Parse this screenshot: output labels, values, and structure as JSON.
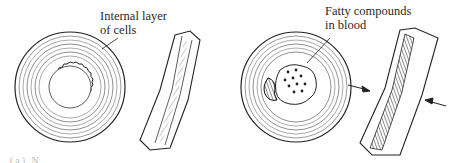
{
  "figure": {
    "panels": [
      {
        "id": "healthy-artery",
        "cross_section_label": "Internal layer\nof cells",
        "label_line1": "Internal layer",
        "label_line2": "of cells"
      },
      {
        "id": "clogged-artery",
        "label_line1": "Fatty compounds",
        "label_line2": "in blood"
      }
    ],
    "caption_fragment": "(a) N"
  },
  "colors": {
    "ink": "#2a2a2a",
    "background": "#ffffff"
  }
}
